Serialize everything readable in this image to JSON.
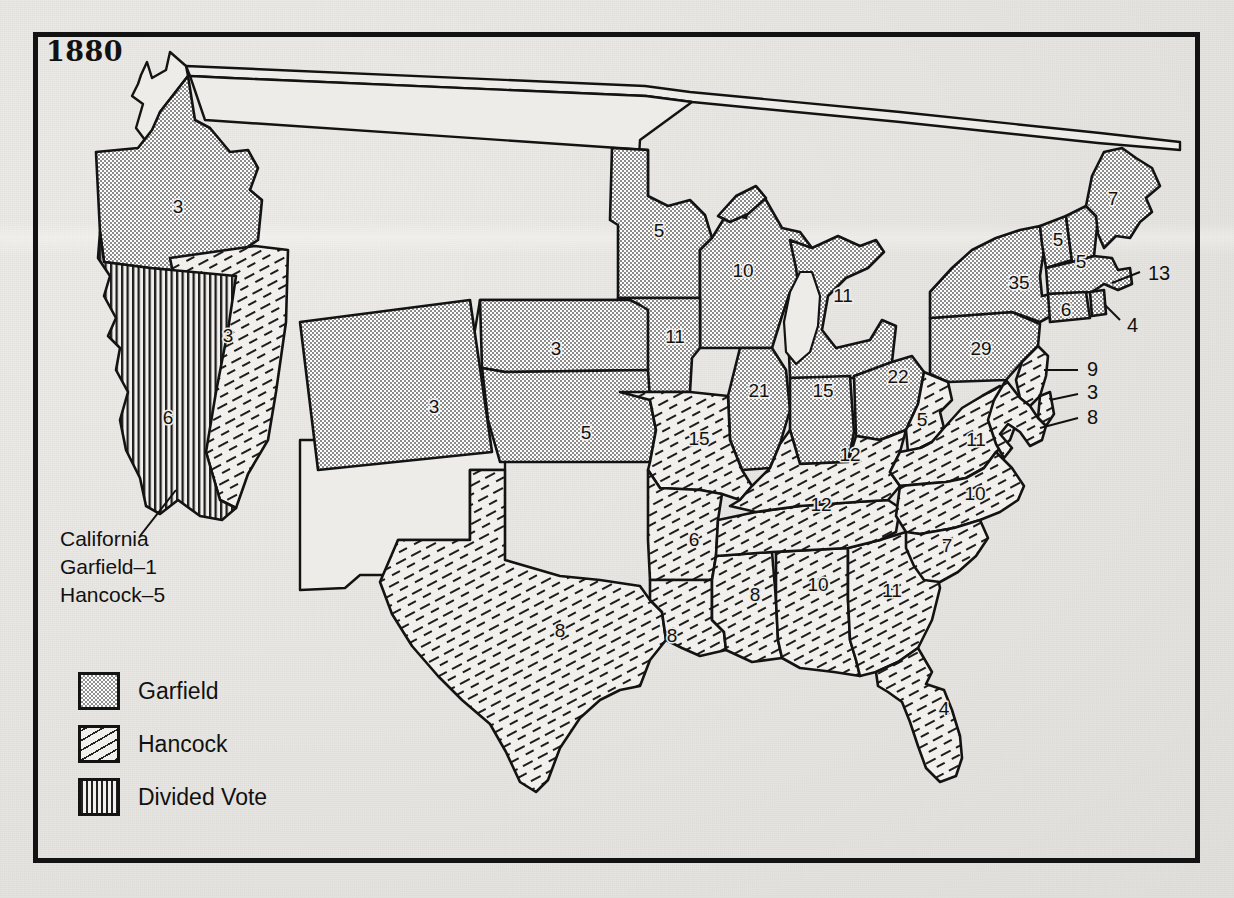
{
  "title": "1880",
  "annotation": {
    "name": "california-note",
    "lines": [
      "California",
      "Garfield–1",
      "Hancock–5"
    ],
    "text": "California\nGarfield–1\nHancock–5"
  },
  "legend": {
    "items": [
      {
        "label": "Garfield",
        "pattern": "dots",
        "swatch_name": "legend-swatch-garfield"
      },
      {
        "label": "Hancock",
        "pattern": "diagonal-hatch",
        "swatch_name": "legend-swatch-hancock"
      },
      {
        "label": "Divided Vote",
        "pattern": "vertical-stripes",
        "swatch_name": "legend-swatch-divided"
      }
    ]
  },
  "colors": {
    "paper": "#e9e7e3",
    "frame": "#131313",
    "ink": "#111111",
    "garfield_fill": "#9a9a9a",
    "hancock_fill": "#f2f0ec",
    "divided_fill": "#f2f0ec",
    "territory_fill": "#eeece8"
  },
  "chart_data": {
    "type": "map",
    "title": "1880",
    "categories": [
      "Garfield",
      "Hancock",
      "Divided Vote"
    ],
    "legend_position": "bottom-left",
    "states": [
      {
        "name": "Oregon",
        "votes": 3,
        "winner": "Garfield",
        "label_x": 178,
        "label_y": 208
      },
      {
        "name": "California",
        "votes": 6,
        "winner": "Divided Vote",
        "label_x": 168,
        "label_y": 419
      },
      {
        "name": "Nevada",
        "votes": 3,
        "winner": "Hancock",
        "label_x": 228,
        "label_y": 337
      },
      {
        "name": "Colorado",
        "votes": 3,
        "winner": "Garfield",
        "label_x": 434,
        "label_y": 408
      },
      {
        "name": "Nebraska",
        "votes": 3,
        "winner": "Garfield",
        "label_x": 556,
        "label_y": 350
      },
      {
        "name": "Kansas",
        "votes": 5,
        "winner": "Garfield",
        "label_x": 586,
        "label_y": 434
      },
      {
        "name": "Texas",
        "votes": 8,
        "winner": "Hancock",
        "label_x": 560,
        "label_y": 632
      },
      {
        "name": "Minnesota",
        "votes": 5,
        "winner": "Garfield",
        "label_x": 659,
        "label_y": 232
      },
      {
        "name": "Iowa",
        "votes": 11,
        "winner": "Garfield",
        "label_x": 675,
        "label_y": 338
      },
      {
        "name": "Missouri",
        "votes": 15,
        "winner": "Hancock",
        "label_x": 699,
        "label_y": 440
      },
      {
        "name": "Arkansas",
        "votes": 6,
        "winner": "Hancock",
        "label_x": 694,
        "label_y": 541
      },
      {
        "name": "Louisiana",
        "votes": 8,
        "winner": "Hancock",
        "label_x": 672,
        "label_y": 637
      },
      {
        "name": "Wisconsin",
        "votes": 10,
        "winner": "Garfield",
        "label_x": 743,
        "label_y": 272
      },
      {
        "name": "Illinois",
        "votes": 21,
        "winner": "Garfield",
        "label_x": 759,
        "label_y": 392
      },
      {
        "name": "Mississippi",
        "votes": 8,
        "winner": "Hancock",
        "label_x": 755,
        "label_y": 596
      },
      {
        "name": "Michigan",
        "votes": 11,
        "winner": "Garfield",
        "label_x": 843,
        "label_y": 297
      },
      {
        "name": "Indiana",
        "votes": 15,
        "winner": "Garfield",
        "label_x": 823,
        "label_y": 392
      },
      {
        "name": "Kentucky",
        "votes": 12,
        "winner": "Hancock",
        "label_x": 850,
        "label_y": 456
      },
      {
        "name": "Tennessee",
        "votes": 12,
        "winner": "Hancock",
        "label_x": 821,
        "label_y": 506
      },
      {
        "name": "Alabama",
        "votes": 10,
        "winner": "Hancock",
        "label_x": 818,
        "label_y": 586
      },
      {
        "name": "Ohio",
        "votes": 22,
        "winner": "Garfield",
        "label_x": 898,
        "label_y": 378
      },
      {
        "name": "West Virginia",
        "votes": 5,
        "winner": "Hancock",
        "label_x": 922,
        "label_y": 421
      },
      {
        "name": "Virginia",
        "votes": 11,
        "winner": "Hancock",
        "label_x": 976,
        "label_y": 441
      },
      {
        "name": "North Carolina",
        "votes": 10,
        "winner": "Hancock",
        "label_x": 975,
        "label_y": 495
      },
      {
        "name": "South Carolina",
        "votes": 7,
        "winner": "Hancock",
        "label_x": 947,
        "label_y": 547
      },
      {
        "name": "Georgia",
        "votes": 11,
        "winner": "Hancock",
        "label_x": 892,
        "label_y": 592
      },
      {
        "name": "Florida",
        "votes": 4,
        "winner": "Hancock",
        "label_x": 944,
        "label_y": 710
      },
      {
        "name": "Pennsylvania",
        "votes": 29,
        "winner": "Garfield",
        "label_x": 981,
        "label_y": 350
      },
      {
        "name": "New York",
        "votes": 35,
        "winner": "Garfield",
        "label_x": 1019,
        "label_y": 284
      },
      {
        "name": "Vermont",
        "votes": 5,
        "winner": "Garfield",
        "label_x": 1058,
        "label_y": 241
      },
      {
        "name": "New Hampshire",
        "votes": 5,
        "winner": "Garfield",
        "label_x": 1081,
        "label_y": 263
      },
      {
        "name": "Maine",
        "votes": 7,
        "winner": "Garfield",
        "label_x": 1113,
        "label_y": 200
      },
      {
        "name": "Connecticut",
        "votes": 6,
        "winner": "Garfield",
        "label_x": 1066,
        "label_y": 311
      },
      {
        "name": "Massachusetts",
        "votes": 13,
        "winner": "Garfield",
        "label_x": 1148,
        "label_y": 275,
        "leader": true
      },
      {
        "name": "Rhode Island",
        "votes": 4,
        "winner": "Garfield",
        "label_x": 1127,
        "label_y": 327,
        "leader": true
      },
      {
        "name": "New Jersey",
        "votes": 9,
        "winner": "Hancock",
        "label_x": 1087,
        "label_y": 371,
        "leader": true
      },
      {
        "name": "Delaware",
        "votes": 3,
        "winner": "Hancock",
        "label_x": 1087,
        "label_y": 394,
        "leader": true
      },
      {
        "name": "Maryland",
        "votes": 8,
        "winner": "Hancock",
        "label_x": 1087,
        "label_y": 419,
        "leader": true
      }
    ],
    "territories": [
      "Washington",
      "Idaho",
      "Montana",
      "Dakota",
      "Wyoming",
      "Utah",
      "Arizona",
      "New Mexico",
      "Indian Territory"
    ]
  }
}
